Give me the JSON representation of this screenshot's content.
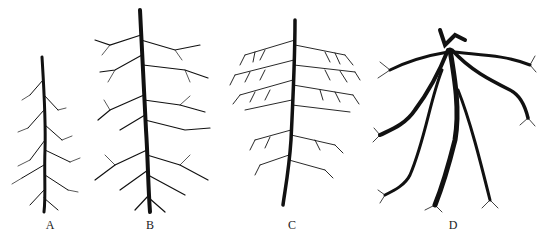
{
  "figure": {
    "type": "botanical-illustration",
    "panels": [
      {
        "id": "A",
        "label": "A",
        "description": "slender taproot with sparse short laterals"
      },
      {
        "id": "B",
        "label": "B",
        "description": "taproot with tiered lateral branching"
      },
      {
        "id": "C",
        "label": "C",
        "description": "dense fibrous-branched root mass"
      },
      {
        "id": "D",
        "label": "D",
        "description": "thick spreading adventitious roots"
      }
    ]
  }
}
